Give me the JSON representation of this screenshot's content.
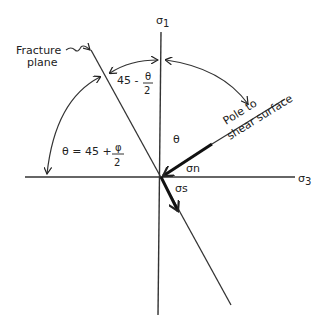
{
  "diagram": {
    "colors": {
      "ink": "#222222",
      "background": "#ffffff"
    },
    "axes": {
      "vertical": {
        "label": "σ",
        "subscript": "1"
      },
      "horizontal": {
        "label": "σ",
        "subscript": "3"
      }
    },
    "labels": {
      "fracture_plane_line1": "Fracture",
      "fracture_plane_line2": "plane",
      "angle_upper_prefix": "45 -",
      "angle_upper_num": "θ",
      "angle_upper_den": "2",
      "angle_lower_prefix": "θ = 45 +",
      "angle_lower_num": "φ",
      "angle_lower_den": "2",
      "theta": "θ",
      "pole_line1": "Pole  to",
      "pole_line2": "shear surface",
      "sigma_n": "σn",
      "sigma_s": "σs"
    }
  }
}
